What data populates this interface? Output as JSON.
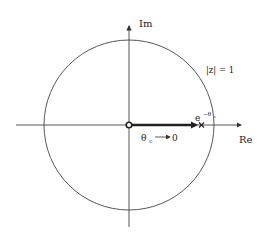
{
  "diagram": {
    "type": "complex-plane",
    "axes": {
      "x_label": "Re",
      "y_label": "Im"
    },
    "circle": {
      "label": "|z| = 1",
      "center": [
        129,
        125
      ],
      "radius": 85
    },
    "origin_marker": "open-circle",
    "arrow_label": {
      "left": "θ",
      "left_subscript": "c",
      "right": "0"
    },
    "pole": {
      "label_base": "e",
      "label_superscript": "−θ",
      "label_superscript_sub": "c",
      "marker": "x"
    },
    "colors": {
      "line": "#333333",
      "text": "#222222",
      "background": "#ffffff"
    }
  }
}
